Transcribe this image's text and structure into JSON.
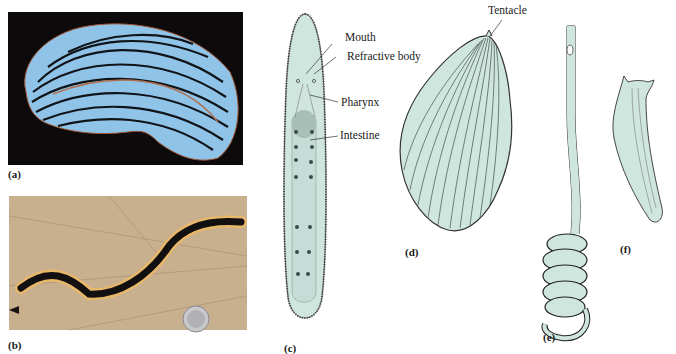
{
  "figure": {
    "panels": [
      {
        "id": "a",
        "label": "(a)",
        "type": "photograph",
        "subject": "blue striped flatworm on black background"
      },
      {
        "id": "b",
        "label": "(b)",
        "type": "photograph",
        "subject": "black and yellow striped land planarian on leaf with coin for scale"
      },
      {
        "id": "c",
        "label": "(c)",
        "type": "drawing",
        "subject": "elongate flatworm anatomy"
      },
      {
        "id": "d",
        "label": "(d)",
        "type": "drawing",
        "subject": "broad polyclad-like flatworm with tentacle"
      },
      {
        "id": "e",
        "label": "(e)",
        "type": "drawing",
        "subject": "coiled elongate worm"
      },
      {
        "id": "f",
        "label": "(f)",
        "type": "drawing",
        "subject": "small flatworm"
      }
    ],
    "annotations": {
      "mouth": "Mouth",
      "refractive_body": "Refractive body",
      "pharynx": "Pharynx",
      "intestine": "Intestine",
      "tentacle": "Tentacle"
    },
    "colors": {
      "drawing_fill": "#cfe6df",
      "photo_a_bg": "#0c0a0a",
      "photo_a_worm": "#8fc4e8",
      "photo_b_bg": "#c8b08f",
      "photo_b_worm_stripe": "#e8b86a"
    }
  }
}
